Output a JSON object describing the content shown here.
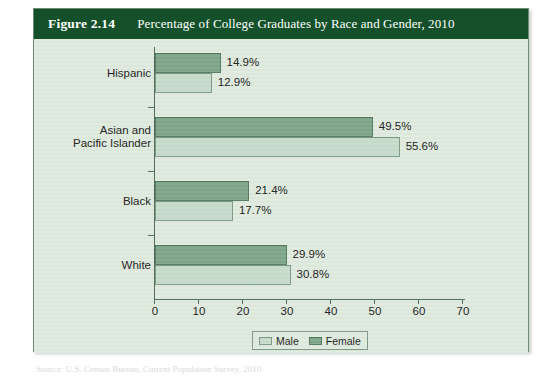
{
  "figure": {
    "number": "Figure 2.14",
    "title": "Percentage of College Graduates by Race and Gender, 2010",
    "source_note": "Source: U.S. Census Bureau, Current Population Survey, 2010"
  },
  "colors": {
    "header_bg": "#14512a",
    "header_text": "#ffffff",
    "plot_bg": "#dfeade",
    "female_bar": "#7fa68a",
    "male_bar": "#c6dccb",
    "axis": "#4c6a55",
    "page_bg": "#ffffff"
  },
  "legend": {
    "items": [
      {
        "label": "Male",
        "color": "#c6dccb"
      },
      {
        "label": "Female",
        "color": "#7fa68a"
      }
    ]
  },
  "chart_data": {
    "type": "bar",
    "orientation": "horizontal",
    "title": "Percentage of College Graduates by Race and Gender, 2010",
    "xlabel": "",
    "ylabel": "",
    "xlim": [
      0,
      70
    ],
    "xticks": [
      0,
      10,
      20,
      30,
      40,
      50,
      60,
      70
    ],
    "xtick_labels": [
      "0",
      "10",
      "20",
      "30",
      "40",
      "50",
      "60",
      "70"
    ],
    "grid": false,
    "legend_position": "bottom",
    "categories": [
      "Hispanic",
      "Asian and Pacific Islander",
      "Black",
      "White"
    ],
    "category_label_lines": [
      [
        "Hispanic"
      ],
      [
        "Asian and",
        "Pacific Islander"
      ],
      [
        "Black"
      ],
      [
        "White"
      ]
    ],
    "series": [
      {
        "name": "Female",
        "color": "#7fa68a",
        "values": [
          14.9,
          49.5,
          21.4,
          29.9
        ],
        "value_labels": [
          "14.9%",
          "49.5%",
          "21.4%",
          "29.9%"
        ]
      },
      {
        "name": "Male",
        "color": "#c6dccb",
        "values": [
          12.9,
          55.6,
          17.7,
          30.8
        ],
        "value_labels": [
          "12.9%",
          "55.6%",
          "17.7%",
          "30.8%"
        ]
      }
    ]
  }
}
